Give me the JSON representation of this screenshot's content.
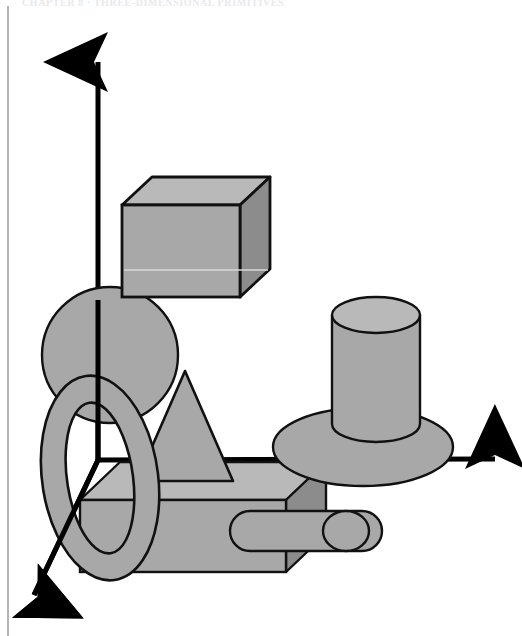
{
  "page": {
    "header_text": "CHAPTER 8  ·  THREE-DIMENSIONAL PRIMITIVES",
    "background_color": "#ffffff",
    "margin_rule_color": "#b4b4b8",
    "width": 522,
    "height": 636
  },
  "figure": {
    "palette": {
      "outline": "#111111",
      "face_light": "#b9b9b9",
      "face_mid": "#a8a8a8",
      "face_dark": "#8c8c8c",
      "axis": "#000000"
    },
    "axes": [
      {
        "name": "y-axis",
        "label": "vertical axis arrow",
        "from": [
          98,
          460
        ],
        "to": [
          98,
          52
        ],
        "direction": "up"
      },
      {
        "name": "x-axis",
        "label": "horizontal axis arrow",
        "from": [
          98,
          460
        ],
        "to": [
          505,
          459
        ],
        "direction": "right"
      },
      {
        "name": "z-axis",
        "label": "depth axis arrow",
        "from": [
          98,
          460
        ],
        "to": [
          28,
          607
        ],
        "direction": "down-left"
      }
    ],
    "shapes": [
      {
        "name": "sphere",
        "kind": "sphere",
        "center": [
          110,
          355
        ],
        "radius": 68,
        "fill": "#a8a8a8"
      },
      {
        "name": "cube",
        "kind": "cube",
        "front_rect": [
          122,
          205,
          118,
          92
        ],
        "depth_offset": [
          30,
          -28
        ],
        "fill_front": "#a8a8a8",
        "fill_top": "#b9b9b9",
        "fill_side": "#8c8c8c"
      },
      {
        "name": "torus",
        "kind": "torus",
        "center": [
          100,
          478
        ],
        "outer_rx": 58,
        "outer_ry": 103,
        "inner_rx": 33,
        "inner_ry": 76,
        "rotation_deg": -8,
        "fill": "#a8a8a8"
      },
      {
        "name": "cone",
        "kind": "cone",
        "apex": [
          185,
          371
        ],
        "base_left": [
          137,
          481
        ],
        "base_right": [
          233,
          481
        ],
        "fill": "#a8a8a8"
      },
      {
        "name": "box",
        "kind": "cuboid",
        "front_rect": [
          80,
          500,
          206,
          72
        ],
        "depth_offset": [
          40,
          -38
        ],
        "fill_front": "#a8a8a8",
        "fill_top": "#b9b9b9",
        "fill_side": "#8c8c8c"
      },
      {
        "name": "disk",
        "kind": "disk",
        "center": [
          363,
          447
        ],
        "rx": 90,
        "ry": 39,
        "fill": "#a8a8a8"
      },
      {
        "name": "cylinder",
        "kind": "cylinder",
        "center_top": [
          376,
          315
        ],
        "rx": 44,
        "ry": 18,
        "height": 109,
        "fill_body": "#a8a8a8",
        "fill_cap": "#b9b9b9"
      },
      {
        "name": "capsule",
        "kind": "capsule",
        "from": [
          250,
          531
        ],
        "to": [
          362,
          531
        ],
        "radius": 20,
        "fill": "#a8a8a8"
      }
    ]
  }
}
